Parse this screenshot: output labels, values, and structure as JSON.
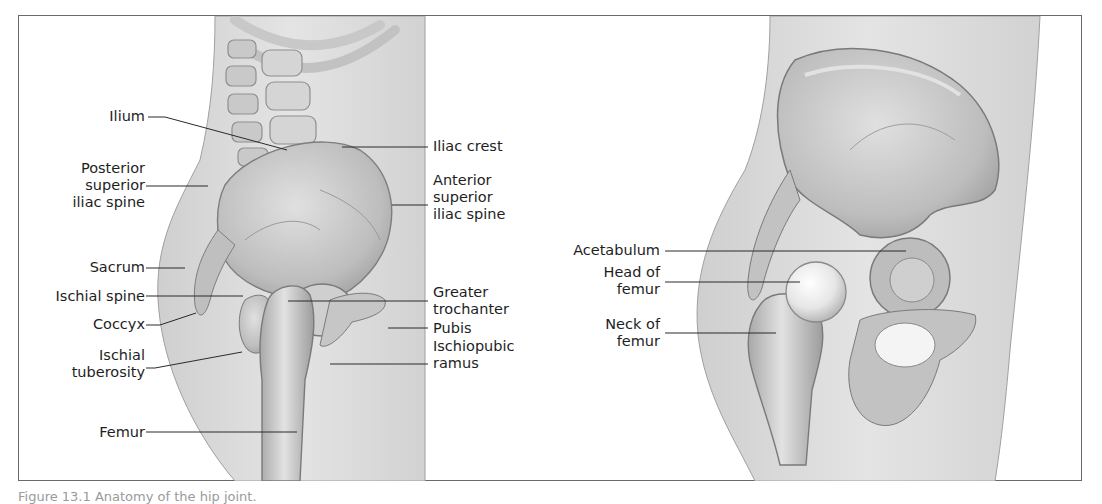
{
  "figure": {
    "type": "anatomical-illustration",
    "panels": [
      {
        "id": "left",
        "view": "lateral view of pelvis, sacrum and femur",
        "labels": [
          {
            "text": "Ilium"
          },
          {
            "text": "Posterior\nsuperior\niliac spine"
          },
          {
            "text": "Sacrum"
          },
          {
            "text": "Ischial spine"
          },
          {
            "text": "Coccyx"
          },
          {
            "text": "Ischial\ntuberosity"
          },
          {
            "text": "Femur"
          },
          {
            "text": "Iliac crest"
          },
          {
            "text": "Anterior\nsuperior\niliac spine"
          },
          {
            "text": "Greater\ntrochanter"
          },
          {
            "text": "Pubis"
          },
          {
            "text": "Ischiopubic\nramus"
          }
        ]
      },
      {
        "id": "right",
        "view": "lateral view of hip joint with femoral head",
        "labels": [
          {
            "text": "Acetabulum"
          },
          {
            "text": "Head of\nfemur"
          },
          {
            "text": "Neck of\nfemur"
          }
        ]
      }
    ],
    "caption": "Figure 13.1  Anatomy of the hip joint."
  },
  "colors": {
    "skin": "#d9d9d9",
    "bone": "#c4c4c4",
    "bone_dark": "#8a8a8a",
    "frame": "#6a6a6a",
    "leader": "#2a2a2a"
  }
}
